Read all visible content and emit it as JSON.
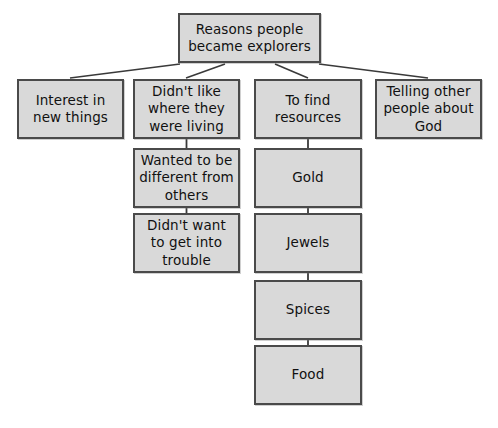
{
  "diagram": {
    "type": "hierarchy-tree",
    "title": "Reasons people became explorers",
    "colors": {
      "node_fill": "#d9d9d9",
      "node_border": "#4a4a4a",
      "connector": "#3a3a3a",
      "background": "#ffffff",
      "text": "#111111"
    },
    "root": {
      "id": "root",
      "label": "Reasons people\nbecame explorers"
    },
    "branches": [
      {
        "id": "interest",
        "label": "Interest in\nnew things",
        "children": []
      },
      {
        "id": "didntlike",
        "label": "Didn't like\nwhere they\nwere living",
        "children": [
          {
            "id": "different",
            "label": "Wanted to be\ndifferent from\nothers"
          },
          {
            "id": "trouble",
            "label": "Didn't want\nto get into\ntrouble"
          }
        ]
      },
      {
        "id": "resources",
        "label": "To find\nresources",
        "children": [
          {
            "id": "gold",
            "label": "Gold"
          },
          {
            "id": "jewels",
            "label": "Jewels"
          },
          {
            "id": "spices",
            "label": "Spices"
          },
          {
            "id": "food",
            "label": "Food"
          }
        ]
      },
      {
        "id": "telling",
        "label": "Telling other\npeople about\nGod",
        "children": []
      }
    ]
  }
}
